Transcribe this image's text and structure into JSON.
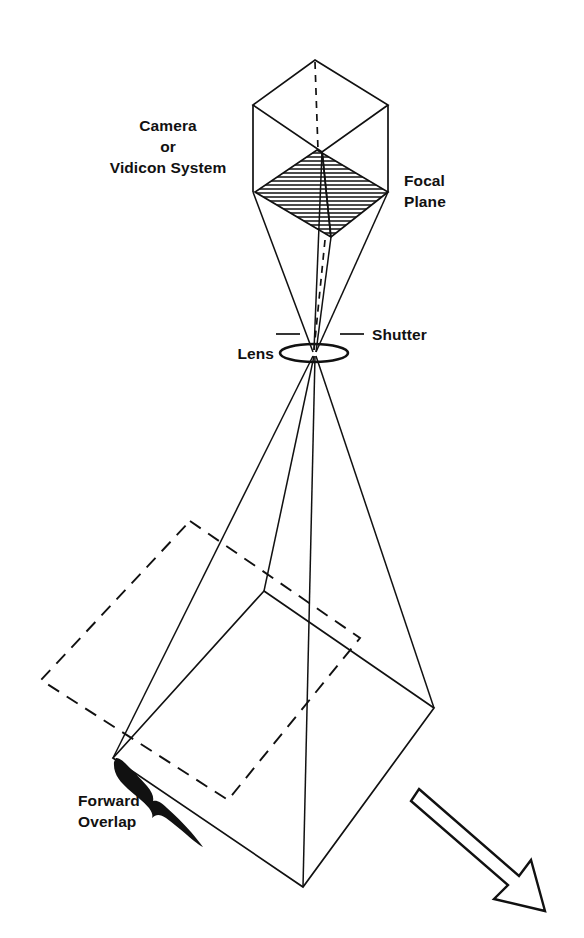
{
  "figure": {
    "type": "line-diagram",
    "background_color": "#ffffff",
    "line_color": "#111111"
  },
  "labels": {
    "camera_line1": "Camera",
    "camera_line2": "or",
    "camera_line3": "Vidicon System",
    "focal_line1": "Focal",
    "focal_line2": "Plane",
    "shutter": "Shutter",
    "lens": "Lens",
    "overlap_line1": "Forward",
    "overlap_line2": "Overlap"
  },
  "caption": {
    "clipped_text": ""
  },
  "geometry": {
    "camera_box": {
      "top_apex": [
        315,
        60
      ],
      "top_left": [
        253,
        105
      ],
      "top_right": [
        388,
        105
      ],
      "top_inner": [
        322,
        152
      ],
      "left_bottom": [
        253,
        192
      ],
      "right_bottom": [
        388,
        192
      ]
    },
    "focal_plane": {
      "top": [
        317,
        150
      ],
      "left": [
        255,
        192
      ],
      "right": [
        388,
        192
      ],
      "bottom": [
        331,
        237
      ],
      "hatch_spacing": 4,
      "hatch_direction": "horizontal"
    },
    "lens": {
      "center": [
        314,
        353
      ],
      "radius_x": 34,
      "radius_y": 9
    },
    "shutter": {
      "left_dash": [
        [
          276,
          334
        ],
        [
          300,
          334
        ]
      ],
      "right_dash": [
        [
          340,
          334
        ],
        [
          364,
          334
        ]
      ]
    },
    "ground_rhombus": {
      "top": [
        264,
        591
      ],
      "right": [
        434,
        708
      ],
      "bottom": [
        303,
        887
      ],
      "left": [
        113,
        758
      ]
    },
    "dashed_rectangle": {
      "top": [
        190,
        521
      ],
      "right": [
        360,
        638
      ],
      "bottom": [
        228,
        800
      ],
      "left": [
        41,
        680
      ]
    },
    "flight_arrow": {
      "start": [
        416,
        790
      ],
      "tip": [
        540,
        898
      ],
      "style": "outlined-open-arrow"
    }
  }
}
